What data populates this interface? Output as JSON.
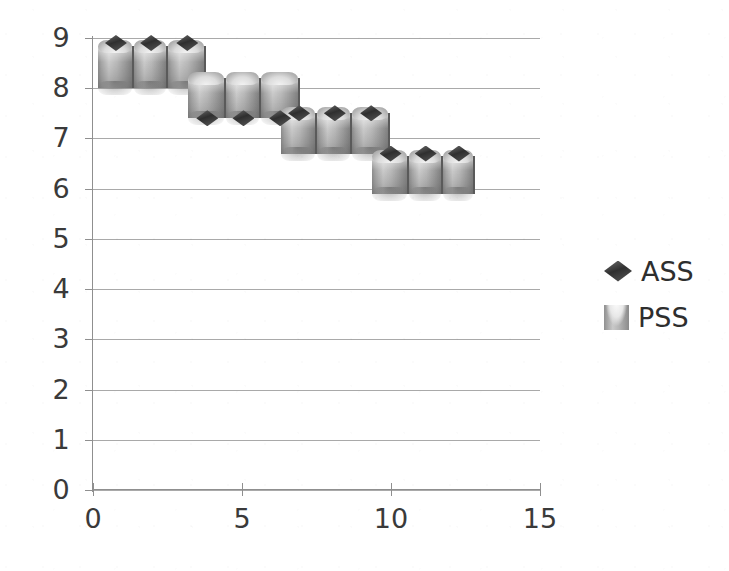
{
  "chart_data": {
    "type": "bar",
    "title": "",
    "subtitle": "",
    "xlabel": "",
    "ylabel": "",
    "xlim": [
      0,
      15
    ],
    "ylim": [
      0,
      9
    ],
    "x_ticks": [
      "0",
      "5",
      "10",
      "15"
    ],
    "x_tick_values": [
      0,
      5,
      10,
      15
    ],
    "y_ticks": [
      "0",
      "1",
      "2",
      "3",
      "4",
      "5",
      "6",
      "7",
      "8",
      "9"
    ],
    "y_tick_values": [
      0,
      1,
      2,
      3,
      4,
      5,
      6,
      7,
      8,
      9
    ],
    "grid": true,
    "grid_axis": "y",
    "legend_position": "right",
    "legend": [
      "ASS",
      "PSS"
    ],
    "series": [
      {
        "name": "PSS",
        "render": "bar-3d-cylinder",
        "color": "#b5b5b5",
        "x": [
          0.55,
          1.75,
          2.95,
          4.2,
          5.4,
          6.6,
          7.85,
          9.05,
          10.25,
          11.5,
          12.7,
          13.9
        ],
        "bar_base": [
          8.0,
          8.0,
          8.0,
          7.4,
          7.4,
          7.4,
          6.7,
          6.7,
          6.7,
          5.9,
          5.9,
          5.9
        ],
        "values": [
          8.85,
          8.85,
          8.85,
          8.2,
          8.2,
          8.2,
          7.5,
          7.5,
          7.5,
          6.65,
          6.65,
          6.65
        ]
      },
      {
        "name": "ASS",
        "render": "diamond-marker",
        "color": "#3a3a3a",
        "x": [
          0.55,
          1.75,
          2.95,
          4.2,
          5.4,
          6.6,
          7.85,
          9.05,
          10.25,
          11.5,
          12.7,
          13.9
        ],
        "values": [
          8.9,
          8.9,
          8.9,
          7.4,
          7.4,
          7.4,
          7.5,
          7.5,
          7.5,
          6.65,
          6.65,
          6.65
        ]
      }
    ],
    "bars": [
      {
        "group": 1,
        "index": 1,
        "x_left": 0.17,
        "x_right": 1.37,
        "top": 8.85,
        "bottom": 8.0,
        "marker": 8.9
      },
      {
        "group": 1,
        "index": 2,
        "x_left": 1.37,
        "x_right": 2.53,
        "top": 8.85,
        "bottom": 8.0,
        "marker": 8.9
      },
      {
        "group": 1,
        "index": 3,
        "x_left": 2.53,
        "x_right": 3.8,
        "top": 8.85,
        "bottom": 8.0,
        "marker": 8.9
      },
      {
        "group": 2,
        "index": 4,
        "x_left": 3.2,
        "x_right": 4.47,
        "top": 8.2,
        "bottom": 7.4,
        "marker": 7.4
      },
      {
        "group": 2,
        "index": 5,
        "x_left": 4.47,
        "x_right": 5.63,
        "top": 8.2,
        "bottom": 7.4,
        "marker": 7.4
      },
      {
        "group": 2,
        "index": 6,
        "x_left": 5.63,
        "x_right": 6.93,
        "top": 8.2,
        "bottom": 7.4,
        "marker": 7.4
      },
      {
        "group": 3,
        "index": 7,
        "x_left": 6.3,
        "x_right": 7.53,
        "top": 7.5,
        "bottom": 6.7,
        "marker": 7.5
      },
      {
        "group": 3,
        "index": 8,
        "x_left": 7.53,
        "x_right": 8.7,
        "top": 7.5,
        "bottom": 6.7,
        "marker": 7.5
      },
      {
        "group": 3,
        "index": 9,
        "x_left": 8.7,
        "x_right": 9.97,
        "top": 7.5,
        "bottom": 6.7,
        "marker": 7.5
      },
      {
        "group": 4,
        "index": 10,
        "x_left": 9.37,
        "x_right": 10.6,
        "top": 6.65,
        "bottom": 5.9,
        "marker": 6.7
      },
      {
        "group": 4,
        "index": 11,
        "x_left": 10.6,
        "x_right": 11.73,
        "top": 6.65,
        "bottom": 5.9,
        "marker": 6.7
      },
      {
        "group": 4,
        "index": 12,
        "x_left": 11.73,
        "x_right": 12.83,
        "top": 6.65,
        "bottom": 5.9,
        "marker": 6.7
      }
    ]
  },
  "legend": {
    "items": [
      {
        "label": "ASS",
        "icon": "diamond-marker-icon"
      },
      {
        "label": "PSS",
        "icon": "bar-swatch-icon"
      }
    ]
  }
}
